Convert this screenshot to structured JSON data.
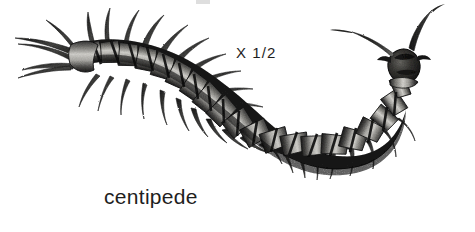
{
  "page": {
    "width": 475,
    "height": 232,
    "background_color": "#ffffff",
    "kind": "scanned-book-illustration"
  },
  "illustration": {
    "subject": "centipede",
    "style": "black-and-white halftone ink drawing",
    "orientation": "U-shaped body curving from tail at upper-left down through the bottom center and up to the head at upper-right",
    "segment_count": 20,
    "leg_pairs": 20,
    "antennae_count": 2,
    "terminal_legs_count": 2,
    "colors": {
      "body_dark": "#252525",
      "body_mid": "#6b6b6b",
      "plate_light": "#c9c8c4",
      "plate_highlight": "#e6e5e1",
      "leg_dark": "#1f1f1f",
      "outline": "#111111"
    }
  },
  "labels": {
    "scale": "X 1/2",
    "caption": "centipede"
  },
  "artifacts": {
    "top_smudge": "faint gray scan mark"
  }
}
